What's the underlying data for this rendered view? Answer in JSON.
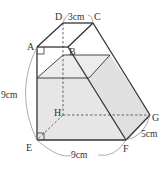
{
  "diagram": {
    "type": "geometry-solid",
    "vertices": {
      "A": "A",
      "B": "B",
      "C": "C",
      "D": "D",
      "E": "E",
      "F": "F",
      "G": "G",
      "H": "H"
    },
    "dimensions": {
      "DC": "3cm",
      "AE": "9cm",
      "EF": "9cm",
      "FG": "5cm"
    },
    "colors": {
      "edge": "#333333",
      "hidden_edge": "#555555",
      "water": "#e6e6e6",
      "arc": "#888888"
    }
  }
}
